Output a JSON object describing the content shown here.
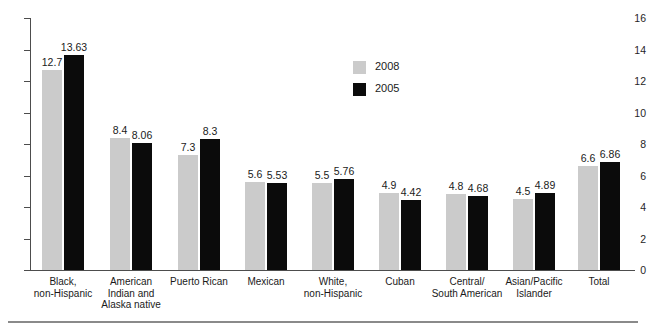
{
  "chart_data": {
    "type": "bar",
    "title": "",
    "subtitle": "",
    "xlabel": "",
    "ylabel": "",
    "ylim": [
      0,
      16
    ],
    "ytick_step": 2,
    "yticks": [
      "16",
      "14",
      "12",
      "10",
      "8",
      "6",
      "4",
      "2",
      "0"
    ],
    "grid": false,
    "legend_position": "upper-center",
    "categories": [
      "Black,\nnon-Hispanic",
      "American\nIndian and\nAlaska native",
      "Puerto Rican",
      "Mexican",
      "White,\nnon-Hispanic",
      "Cuban",
      "Central/\nSouth American",
      "Asian/Pacific\nIslander",
      "Total"
    ],
    "series": [
      {
        "name": "2008",
        "color": "#cbcbcb",
        "values": [
          12.7,
          8.4,
          7.3,
          5.6,
          5.5,
          4.9,
          4.8,
          4.5,
          6.6
        ],
        "labels": [
          "12.7",
          "8.4",
          "7.3",
          "5.6",
          "5.5",
          "4.9",
          "4.8",
          "4.5",
          "6.6"
        ]
      },
      {
        "name": "2005",
        "color": "#0b0b0b",
        "values": [
          13.63,
          8.06,
          8.3,
          5.53,
          5.76,
          4.42,
          4.68,
          4.89,
          6.86
        ],
        "labels": [
          "13.63",
          "8.06",
          "8.3",
          "5.53",
          "5.76",
          "4.42",
          "4.68",
          "4.89",
          "6.86"
        ]
      }
    ]
  },
  "legend": {
    "items": [
      {
        "label": "2008",
        "swatch": "#cbcbcb"
      },
      {
        "label": "2005",
        "swatch": "#0b0b0b"
      }
    ]
  },
  "axis": {
    "y_labels": [
      "16",
      "14",
      "12",
      "10",
      "8",
      "6",
      "4",
      "2",
      "0"
    ]
  },
  "categories_display": [
    {
      "line1": "Black,",
      "line2": "non-Hispanic",
      "line3": ""
    },
    {
      "line1": "American",
      "line2": "Indian and",
      "line3": "Alaska native"
    },
    {
      "line1": "Puerto Rican",
      "line2": "",
      "line3": ""
    },
    {
      "line1": "Mexican",
      "line2": "",
      "line3": ""
    },
    {
      "line1": "White,",
      "line2": "non-Hispanic",
      "line3": ""
    },
    {
      "line1": "Cuban",
      "line2": "",
      "line3": ""
    },
    {
      "line1": "Central/",
      "line2": "South American",
      "line3": ""
    },
    {
      "line1": "Asian/Pacific",
      "line2": "Islander",
      "line3": ""
    },
    {
      "line1": "Total",
      "line2": "",
      "line3": ""
    }
  ],
  "bar_labels": {
    "g0": {
      "a": "12.7",
      "b": "13.63"
    },
    "g1": {
      "a": "8.4",
      "b": "8.06"
    },
    "g2": {
      "a": "7.3",
      "b": "8.3"
    },
    "g3": {
      "a": "5.6",
      "b": "5.53"
    },
    "g4": {
      "a": "5.5",
      "b": "5.76"
    },
    "g5": {
      "a": "4.9",
      "b": "4.42"
    },
    "g6": {
      "a": "4.8",
      "b": "4.68"
    },
    "g7": {
      "a": "4.5",
      "b": "4.89"
    },
    "g8": {
      "a": "6.6",
      "b": "6.86"
    }
  },
  "colors": {
    "series_2008": "#cbcbcb",
    "series_2005": "#0b0b0b",
    "axis": "#4d4d4d",
    "rule": "#8a8a8a",
    "text": "#1a1a1a",
    "background": "#ffffff"
  }
}
